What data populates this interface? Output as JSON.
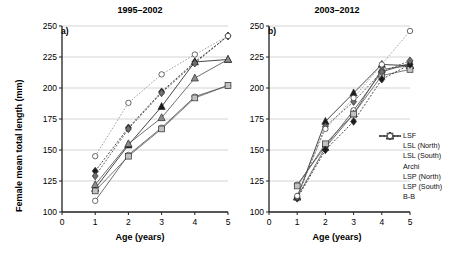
{
  "figure": {
    "ylabel": "Female mean total length (mm)",
    "xlabel_a": "Age (years)",
    "xlabel_b": "Age (years)",
    "panel_a_letter": "a)",
    "panel_b_letter": "b)",
    "panel_a_title": "1995–2002",
    "panel_b_title": "2003–2012",
    "yticks": [
      "100",
      "125",
      "150",
      "175",
      "200",
      "225",
      "250"
    ],
    "xticks": [
      "0",
      "1",
      "2",
      "3",
      "4",
      "5"
    ]
  },
  "legend": {
    "items": [
      {
        "label": "LSF",
        "marker": "open-circle",
        "line": "solid",
        "fill": "#ffffff"
      },
      {
        "label": "LSL (North)",
        "marker": "filled-triangle",
        "line": "solid",
        "fill": "#1a1a1a"
      },
      {
        "label": "LSL (South)",
        "marker": "gray-triangle",
        "line": "solid",
        "fill": "#8c8c8c"
      },
      {
        "label": "Archi",
        "marker": "gray-square",
        "line": "solid",
        "fill": "#bdbdbd"
      },
      {
        "label": "LSP (North)",
        "marker": "filled-diamond",
        "line": "dashed",
        "fill": "#1a1a1a"
      },
      {
        "label": "LSP (South)",
        "marker": "gray-diamond",
        "line": "dashed",
        "fill": "#6e6e6e"
      },
      {
        "label": "B-B",
        "marker": "open-circle",
        "line": "dashed",
        "fill": "#ffffff"
      }
    ]
  },
  "chart_data": {
    "type": "line",
    "xlabel": "Age (years)",
    "ylabel": "Female mean total length (mm)",
    "xlim": [
      0,
      5
    ],
    "ylim": [
      100,
      250
    ],
    "xticks": [
      0,
      1,
      2,
      3,
      4,
      5
    ],
    "yticks": [
      100,
      125,
      150,
      175,
      200,
      225,
      250
    ],
    "grid": "horizontal",
    "legend_position": "right-outside",
    "panels": [
      {
        "panel": "a",
        "title": "1995–2002",
        "x": [
          1,
          2,
          3,
          4,
          5
        ],
        "series": [
          {
            "name": "LSF",
            "values": [
              109,
              146,
              168,
              193,
              202
            ]
          },
          {
            "name": "LSL (North)",
            "values": [
              119,
              154,
              185,
              221,
              223
            ]
          },
          {
            "name": "LSL (South)",
            "values": [
              122,
              155,
              176,
              208,
              223
            ]
          },
          {
            "name": "Archi",
            "values": [
              117,
              145,
              167,
              192,
              202
            ]
          },
          {
            "name": "LSP (North)",
            "values": [
              133,
              168,
              197,
              221,
              242
            ]
          },
          {
            "name": "LSP (South)",
            "values": [
              129,
              167,
              196,
              220,
              242
            ]
          },
          {
            "name": "B-B",
            "values": [
              145,
              188,
              211,
              227,
              242
            ]
          }
        ]
      },
      {
        "panel": "b",
        "title": "2003–2012",
        "x": [
          1,
          2,
          3,
          4,
          5
        ],
        "series": [
          {
            "name": "LSF",
            "values": [
              122,
              153,
              182,
              213,
              220
            ]
          },
          {
            "name": "LSL (North)",
            "values": [
              112,
              173,
              196,
              219,
              218
            ]
          },
          {
            "name": "LSL (South)",
            "values": [
              112,
              152,
              179,
              215,
              218
            ]
          },
          {
            "name": "Archi",
            "values": [
              121,
              155,
              179,
              210,
              215
            ]
          },
          {
            "name": "LSP (North)",
            "values": [
              111,
              150,
              173,
              207,
              219
            ]
          },
          {
            "name": "LSP (South)",
            "values": [
              112,
              169,
              189,
              213,
              222
            ]
          },
          {
            "name": "B-B",
            "values": [
              113,
              167,
              192,
              219,
              246
            ]
          }
        ]
      }
    ]
  }
}
